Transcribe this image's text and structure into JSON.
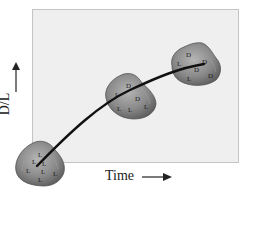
{
  "diagram": {
    "x_axis": {
      "label": "Time",
      "arrow": "right-arrow"
    },
    "y_axis": {
      "label": "D/L",
      "arrow": "up-arrow"
    },
    "colors": {
      "plot_background": "#efefef",
      "shell_fill": "#8e8e8e",
      "curve": "#111111"
    },
    "shells": [
      {
        "id": "young",
        "letters": [
          "L",
          "L",
          "L",
          "L",
          "L",
          "L",
          "L"
        ]
      },
      {
        "id": "middle",
        "letters": [
          "D",
          "L",
          "D",
          "L",
          "L",
          "L"
        ]
      },
      {
        "id": "old",
        "letters": [
          "D",
          "L",
          "D",
          "D",
          "L",
          "D"
        ]
      }
    ]
  }
}
